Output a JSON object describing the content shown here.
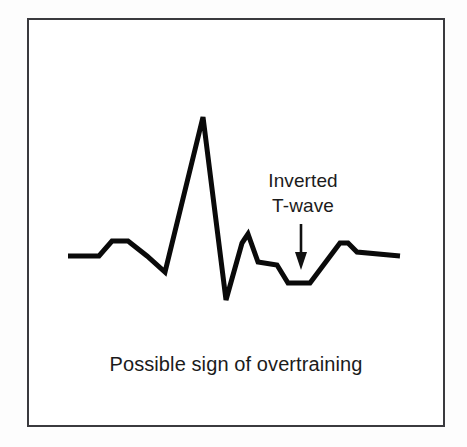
{
  "figure": {
    "kind": "ecg-waveform-diagram",
    "background_color": "#ffffff",
    "frame_color": "#3a3a3e",
    "trace_color": "#0a0a0a",
    "text_color": "#1b1b1b"
  },
  "annotation": {
    "line1": "Inverted",
    "line2": "T-wave",
    "arrow": "down-arrow",
    "arrow_points_to": "inverted T-wave trough"
  },
  "caption": {
    "text": "Possible sign of overtraining"
  },
  "chart_data": {
    "type": "line",
    "title": "Possible sign of overtraining",
    "xlabel": "",
    "ylabel": "",
    "grid": false,
    "legend": "none",
    "annotations": [
      {
        "text": "Inverted T-wave",
        "x": 301,
        "y": 283,
        "arrow": "down",
        "arrow_from_y": 224,
        "arrow_to_y": 268
      }
    ],
    "axis_note": "No axes drawn; y values are screen pixels where smaller y means higher voltage. Baseline is y=256.",
    "baseline_y": 256,
    "xlim": [
      68,
      400
    ],
    "ylim": [
      117,
      300
    ],
    "features": [
      {
        "name": "baseline-left",
        "x": 68,
        "y": 256
      },
      {
        "name": "p-wave-rise-start",
        "x": 99,
        "y": 256
      },
      {
        "name": "p-wave-plateau-start",
        "x": 112,
        "y": 241
      },
      {
        "name": "p-wave-plateau-end",
        "x": 128,
        "y": 241
      },
      {
        "name": "pq-segment",
        "x": 147,
        "y": 256
      },
      {
        "name": "q-trough",
        "x": 165,
        "y": 272
      },
      {
        "name": "r-peak",
        "x": 203,
        "y": 117
      },
      {
        "name": "s-trough",
        "x": 226,
        "y": 300
      },
      {
        "name": "j-point-notch-low",
        "x": 242,
        "y": 243
      },
      {
        "name": "j-point-notch-peak",
        "x": 248,
        "y": 234
      },
      {
        "name": "st-segment-start",
        "x": 258,
        "y": 262
      },
      {
        "name": "st-segment-end",
        "x": 277,
        "y": 265
      },
      {
        "name": "t-wave-trough-start",
        "x": 288,
        "y": 283
      },
      {
        "name": "t-wave-trough-end",
        "x": 310,
        "y": 283
      },
      {
        "name": "u-bump-peak-start",
        "x": 340,
        "y": 243
      },
      {
        "name": "u-bump-peak-end",
        "x": 348,
        "y": 243
      },
      {
        "name": "tail-start",
        "x": 357,
        "y": 252
      },
      {
        "name": "tail-end",
        "x": 400,
        "y": 256
      }
    ],
    "x": [
      68,
      99,
      112,
      128,
      147,
      165,
      203,
      226,
      242,
      244,
      248,
      258,
      277,
      288,
      310,
      340,
      348,
      357,
      400
    ],
    "y": [
      256,
      256,
      241,
      241,
      256,
      272,
      117,
      300,
      243,
      240,
      234,
      262,
      265,
      283,
      283,
      243,
      243,
      252,
      256
    ]
  }
}
